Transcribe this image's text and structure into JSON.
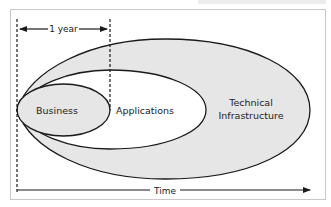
{
  "diagram": {
    "labels": {
      "business": "Business",
      "applications": "Applications",
      "technical_line1": "Technical",
      "technical_line2": "Infrastructure",
      "one_year": "1 year",
      "time": "Time"
    },
    "colors": {
      "fill": "#e6e6e6",
      "inner_fill": "#ffffff",
      "stroke": "#1a1a1a",
      "frame_border": "#c8c8c8"
    },
    "structure": {
      "nesting": [
        "Technical Infrastructure",
        "Applications",
        "Business"
      ],
      "shared_origin": "left point at start of time axis",
      "time_markers": [
        "start",
        "1 year"
      ]
    }
  }
}
